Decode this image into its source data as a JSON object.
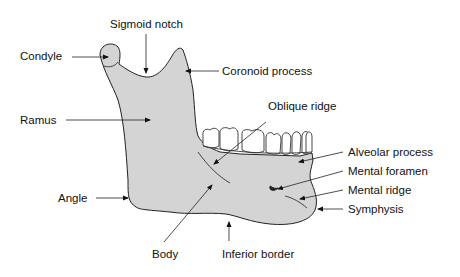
{
  "figure": {
    "colors": {
      "bone": "#d4d4d4",
      "outline": "#222222",
      "teeth": "#ffffff",
      "text": "#111111"
    }
  },
  "labels": {
    "sigmoid_notch": "Sigmoid notch",
    "condyle": "Condyle",
    "coronoid_process": "Coronoid process",
    "ramus": "Ramus",
    "oblique_ridge": "Oblique ridge",
    "alveolar_process": "Alveolar process",
    "mental_foramen": "Mental foramen",
    "mental_ridge": "Mental ridge",
    "symphysis": "Symphysis",
    "angle": "Angle",
    "body": "Body",
    "inferior_border": "Inferior border"
  }
}
